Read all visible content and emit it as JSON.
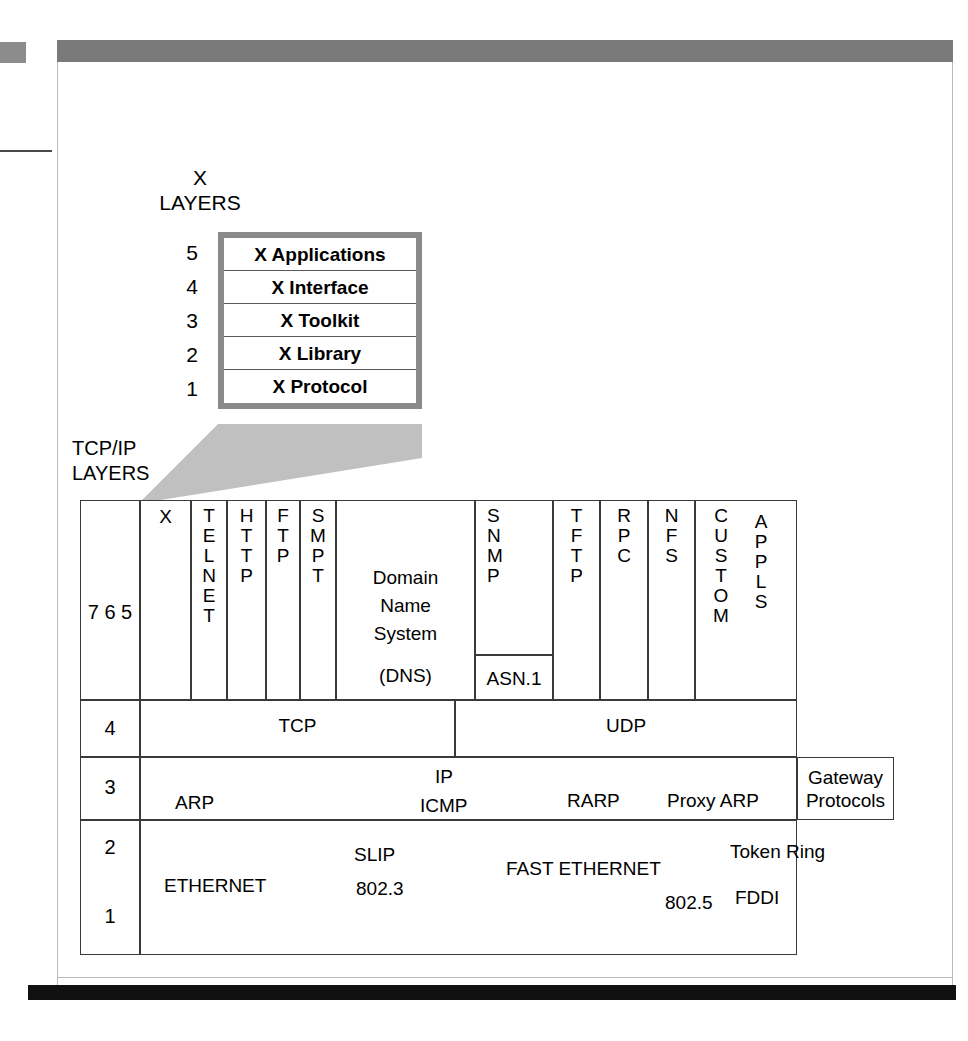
{
  "page": {
    "header_bar_color": "#7a7a7a",
    "footer_bar_color": "#111111"
  },
  "x_layers": {
    "caption": "X\nLAYERS",
    "numbers": [
      "5",
      "4",
      "3",
      "2",
      "1"
    ],
    "rows": [
      "X Applications",
      "X Interface",
      "X Toolkit",
      "X Library",
      "X Protocol"
    ]
  },
  "tcpip": {
    "caption": "TCP/IP\nLAYERS",
    "layer_groups": {
      "app": "7\n6\n5",
      "transport": "4",
      "network": "3",
      "link_upper": "2",
      "link_lower": "1"
    },
    "application_row": {
      "cells": [
        {
          "name": "X",
          "letters": [
            "X"
          ],
          "orientation": "horizontal"
        },
        {
          "name": "TELNET",
          "letters": [
            "T",
            "E",
            "L",
            "N",
            "E",
            "T"
          ],
          "orientation": "vertical"
        },
        {
          "name": "HTTP",
          "letters": [
            "H",
            "T",
            "T",
            "P"
          ],
          "orientation": "vertical"
        },
        {
          "name": "FTP",
          "letters": [
            "F",
            "T",
            "P"
          ],
          "orientation": "vertical"
        },
        {
          "name": "SMPT",
          "letters": [
            "S",
            "M",
            "P",
            "T"
          ],
          "orientation": "vertical"
        },
        {
          "name": "Domain Name System",
          "lines": [
            "Domain",
            "Name",
            "System"
          ],
          "sub": "(DNS)",
          "orientation": "horizontal"
        },
        {
          "name": "SNMP",
          "letters": [
            "S",
            "N",
            "M",
            "P"
          ],
          "orientation": "vertical",
          "sub": "ASN.1"
        },
        {
          "name": "TFTP",
          "letters": [
            "T",
            "F",
            "T",
            "P"
          ],
          "orientation": "vertical"
        },
        {
          "name": "RPC",
          "letters": [
            "R",
            "P",
            "C"
          ],
          "orientation": "vertical"
        },
        {
          "name": "NFS",
          "letters": [
            "N",
            "F",
            "S"
          ],
          "orientation": "vertical"
        },
        {
          "name": "CUSTOM APPLS",
          "letters": [
            "C",
            "U",
            "S",
            "T",
            "O",
            "M"
          ],
          "letters2": [
            "A",
            "P",
            "P",
            "L",
            "S"
          ],
          "orientation": "vertical"
        }
      ]
    },
    "transport_row": {
      "cells": [
        "TCP",
        "UDP"
      ]
    },
    "network_row": {
      "labels": [
        "ARP",
        "IP",
        "ICMP",
        "RARP",
        "Proxy ARP"
      ],
      "gateway": "Gateway\nProtocols"
    },
    "link_row": {
      "labels": [
        "ETHERNET",
        "SLIP",
        "802.3",
        "FAST ETHERNET",
        "802.5",
        "Token Ring",
        "FDDI"
      ]
    }
  }
}
